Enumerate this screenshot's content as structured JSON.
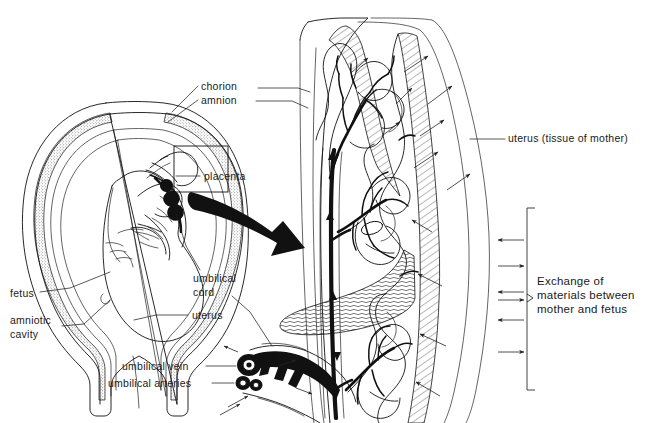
{
  "figure": {
    "background_color": "#ffffff",
    "ink_color": "#111111",
    "width": 655,
    "height": 423
  },
  "labels": {
    "chorion": "chorion",
    "amnion": "amnion",
    "placenta": "placenta",
    "umbilical_cord_line1": "umbilical",
    "umbilical_cord_line2": "cord",
    "fetus": "fetus",
    "amniotic_cavity_line1": "amniotic",
    "amniotic_cavity_line2": "cavity",
    "uterus": "uterus",
    "umbilical_vein": "umbilical vein",
    "umbilical_arteries": "umbilical arteries",
    "uterus_tissue_of_mother": "uterus (tissue of mother)",
    "exchange_line1": "Exchange of",
    "exchange_line2": "materials between",
    "exchange_line3": "mother and fetus"
  },
  "panels": {
    "left_panel_name": "whole-uterus-overview",
    "right_panel_name": "placenta-enlargement",
    "inset_box_name": "placenta-detail-box",
    "magnify_arrow_name": "magnification-arrow"
  },
  "structures": {
    "fetus": "fetus",
    "amniotic_sac": "amniotic-sac",
    "chorionic_villi": "chorionic-villi",
    "maternal_tissue": "maternal-uterine-tissue",
    "umbilical_vein": "umbilical-vein",
    "umbilical_arteries": "umbilical-arteries",
    "cervix": "cervix"
  }
}
